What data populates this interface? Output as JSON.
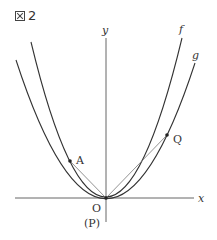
{
  "figure": {
    "title_icon": "figure-mark-icon",
    "title_number": "2"
  },
  "axes": {
    "x_label": "x",
    "y_label": "y",
    "origin_label": "O",
    "origin_alt_label": "(P)"
  },
  "curves": [
    {
      "name": "f",
      "label": "f",
      "type": "parabola",
      "vertex": "O",
      "steeper": true
    },
    {
      "name": "g",
      "label": "g",
      "type": "parabola",
      "vertex": "O",
      "steeper": false
    }
  ],
  "points": [
    {
      "label": "A",
      "on_curve": "f",
      "side": "left"
    },
    {
      "label": "Q",
      "on_curve": "g",
      "side": "right"
    },
    {
      "label": "O",
      "on_curve": "both",
      "side": "origin"
    }
  ],
  "segments": [
    {
      "from": "O",
      "to": "A"
    },
    {
      "from": "O",
      "to": "Q"
    }
  ],
  "colors": {
    "line": "#333333",
    "segment": "#777777"
  }
}
